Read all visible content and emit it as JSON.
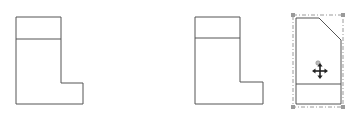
{
  "canvas": {
    "width": 356,
    "height": 121,
    "background": "#ffffff",
    "stroke_color": "#555555",
    "selection_color": "#9a9a9a",
    "handle_color": "#8a8a8a"
  },
  "shapes": [
    {
      "name": "l-shape-1",
      "outline": "16,17 61,17 61,83 83,83 83,104 16,104",
      "divider": {
        "x1": 16,
        "y1": 39,
        "x2": 61,
        "y2": 39
      },
      "selected": false
    },
    {
      "name": "l-shape-2",
      "outline": "195,17 240,17 240,82 263,82 263,104 195,104",
      "divider": {
        "x1": 195,
        "y1": 38,
        "x2": 240,
        "y2": 38
      },
      "selected": false
    },
    {
      "name": "chamfered-shape-3",
      "outline": "296,18 319,18 341,40 341,104 296,104",
      "divider": {
        "x1": 296,
        "y1": 84,
        "x2": 341,
        "y2": 84
      },
      "selected": true,
      "selection_frame": {
        "x": 293,
        "y": 15,
        "width": 50,
        "height": 92
      },
      "handles": [
        {
          "x": 293,
          "y": 15
        },
        {
          "x": 343,
          "y": 15
        },
        {
          "x": 293,
          "y": 107
        },
        {
          "x": 343,
          "y": 107
        }
      ],
      "rotation_handle": {
        "x": 318,
        "y": 63
      },
      "move_cursor": {
        "x": 320,
        "y": 71,
        "icon": "move-cursor-icon"
      }
    }
  ]
}
